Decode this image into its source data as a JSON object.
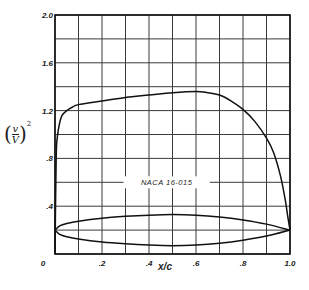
{
  "chart_data": {
    "type": "line",
    "title": "",
    "xlabel": "x/c",
    "ylabel": "(v/V)^2",
    "xlim": [
      0,
      1.0
    ],
    "ylim": [
      0,
      2.0
    ],
    "grid": true,
    "x_ticks": [
      "0",
      ".2",
      ".4",
      ".6",
      ".8",
      "1.0"
    ],
    "y_ticks": [
      ".4",
      ".8",
      "1.2",
      "1.6",
      "2.0"
    ],
    "annotation": "NACA 16-015",
    "series": [
      {
        "name": "velocity distribution (v/V)^2",
        "x": [
          0,
          0.005,
          0.01,
          0.02,
          0.03,
          0.05,
          0.075,
          0.1,
          0.2,
          0.3,
          0.4,
          0.5,
          0.6,
          0.65,
          0.7,
          0.75,
          0.8,
          0.85,
          0.9,
          0.93,
          0.96,
          0.98,
          0.99,
          1.0
        ],
        "y": [
          0.0,
          0.8,
          0.98,
          1.1,
          1.16,
          1.2,
          1.23,
          1.25,
          1.28,
          1.31,
          1.33,
          1.35,
          1.36,
          1.35,
          1.33,
          1.28,
          1.21,
          1.11,
          0.97,
          0.85,
          0.65,
          0.45,
          0.32,
          0.2
        ]
      },
      {
        "name": "airfoil section upper",
        "x": [
          0,
          0.02,
          0.05,
          0.1,
          0.2,
          0.3,
          0.4,
          0.5,
          0.6,
          0.7,
          0.8,
          0.9,
          1.0
        ],
        "y": [
          0.2,
          0.235,
          0.255,
          0.275,
          0.3,
          0.315,
          0.325,
          0.33,
          0.325,
          0.31,
          0.285,
          0.25,
          0.2
        ]
      },
      {
        "name": "airfoil section lower",
        "x": [
          0,
          0.02,
          0.05,
          0.1,
          0.2,
          0.3,
          0.4,
          0.5,
          0.6,
          0.7,
          0.8,
          0.9,
          1.0
        ],
        "y": [
          0.2,
          0.165,
          0.145,
          0.125,
          0.1,
          0.085,
          0.075,
          0.07,
          0.075,
          0.09,
          0.115,
          0.15,
          0.2
        ]
      }
    ]
  },
  "labels": {
    "xlabel": "x/c",
    "ylabel_num": "v",
    "ylabel_den": "V",
    "ylabel_exp": "2",
    "annotation": "NACA 16-015"
  }
}
